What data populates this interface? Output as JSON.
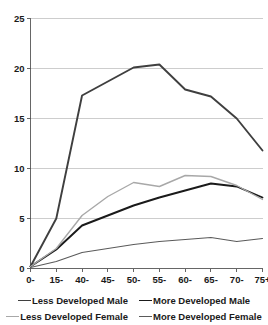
{
  "chart_data": {
    "type": "line",
    "title": "",
    "subtitle": "",
    "xlabel": "",
    "ylabel": "",
    "grid": true,
    "legend_position": "bottom",
    "xlim": [
      0,
      9
    ],
    "ylim": [
      0,
      25
    ],
    "yticks": [
      "0",
      "5",
      "10",
      "15",
      "20",
      "25"
    ],
    "ytick_values": [
      0,
      5,
      10,
      15,
      20,
      25
    ],
    "categories": [
      "0-",
      "15-",
      "40-",
      "45-",
      "50-",
      "55-",
      "60-",
      "65-",
      "70-",
      "75+"
    ],
    "series": [
      {
        "name": "Less Developed Male",
        "color": "#3f3f3f",
        "width": 1.9,
        "values": [
          0.2,
          5.0,
          17.3,
          18.7,
          20.1,
          20.4,
          17.9,
          17.2,
          15.0,
          11.8
        ]
      },
      {
        "name": "More Developed Male",
        "color": "#1a1a1a",
        "width": 1.9,
        "values": [
          0.2,
          1.9,
          4.3,
          5.3,
          6.3,
          7.1,
          7.8,
          8.5,
          8.2,
          7.1
        ]
      },
      {
        "name": "Less Developed Female",
        "color": "#a8a8a8",
        "width": 1.4,
        "values": [
          0.2,
          2.0,
          5.3,
          7.2,
          8.6,
          8.2,
          9.3,
          9.2,
          8.3,
          6.9
        ]
      },
      {
        "name": "More Developed Female",
        "color": "#5a5a5a",
        "width": 1.1,
        "values": [
          0.1,
          0.7,
          1.6,
          2.0,
          2.4,
          2.7,
          2.9,
          3.1,
          2.7,
          3.0
        ]
      }
    ]
  },
  "legend": {
    "rows": [
      [
        {
          "label": "Less Developed Male",
          "color": "#3f3f3f",
          "width": 1.9
        },
        {
          "label": "More Developed Male",
          "color": "#1a1a1a",
          "width": 1.9
        }
      ],
      [
        {
          "label": "Less Developed Female",
          "color": "#a8a8a8",
          "width": 1.4
        },
        {
          "label": "More Developed Female",
          "color": "#5a5a5a",
          "width": 1.1
        }
      ]
    ]
  },
  "axis_colors": {
    "gridline": "#b8b8b8",
    "axis": "#555555",
    "text": "#1a1a1a"
  }
}
